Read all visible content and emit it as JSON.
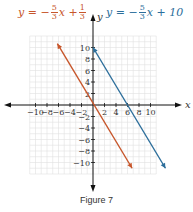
{
  "figure": {
    "caption": "Figure 7"
  },
  "equations": {
    "left": {
      "prefix": "y = −",
      "frac1_num": "5",
      "frac1_den": "3",
      "mid": "x +",
      "frac2_num": "1",
      "frac2_den": "3",
      "color": "#c7562b"
    },
    "right": {
      "prefix": "y = −",
      "frac1_num": "5",
      "frac1_den": "3",
      "suffix": "x + 10",
      "color": "#2c6e9b"
    }
  },
  "chart_data": {
    "type": "line",
    "title": "",
    "xlabel": "x",
    "ylabel": "y",
    "xlim": [
      -11,
      12
    ],
    "ylim": [
      -12,
      12
    ],
    "grid": true,
    "x_ticks": [
      -10,
      -8,
      -6,
      -4,
      -2,
      2,
      4,
      6,
      8,
      10
    ],
    "y_ticks": [
      -10,
      -8,
      -6,
      -4,
      -2,
      2,
      4,
      6,
      8,
      10
    ],
    "series": [
      {
        "name": "y = -5/3x + 1/3",
        "color": "#c7562b",
        "slope": -1.6667,
        "intercept": 0.3333,
        "x": [
          -6.2,
          6.8
        ],
        "y": [
          10.67,
          -11.0
        ]
      },
      {
        "name": "y = -5/3x + 10",
        "color": "#2c6e9b",
        "slope": -1.6667,
        "intercept": 10,
        "x": [
          0,
          12.6
        ],
        "y": [
          10.0,
          -11.0
        ]
      }
    ]
  }
}
